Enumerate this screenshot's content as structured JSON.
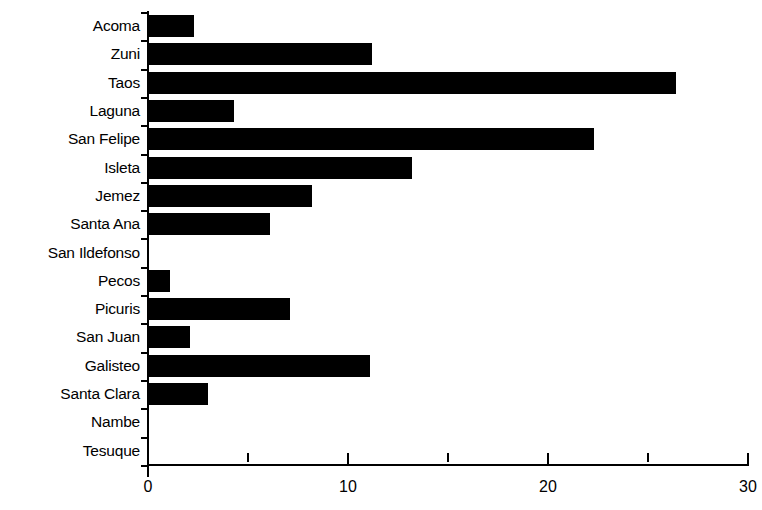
{
  "chart_data": {
    "type": "bar",
    "orientation": "horizontal",
    "title": "",
    "subtitle": "",
    "xlabel": "",
    "ylabel": "",
    "xlim": [
      0,
      30
    ],
    "ylim": null,
    "grid": false,
    "legend": null,
    "bar_color": "#000000",
    "background_color": "#ffffff",
    "axis_color": "#000000",
    "x_ticks_major": [
      "0",
      "10",
      "20",
      "30"
    ],
    "x_ticks_major_values": [
      0,
      10,
      20,
      30
    ],
    "x_ticks_minor_values": [
      5,
      15,
      25
    ],
    "categories": [
      "Acoma",
      "Zuni",
      "Taos",
      "Laguna",
      "San Felipe",
      "Isleta",
      "Jemez",
      "Santa Ana",
      "San Ildefonso",
      "Pecos",
      "Picuris",
      "San Juan",
      "Galisteo",
      "Santa Clara",
      "Nambe",
      "Tesuque"
    ],
    "values": [
      2.3,
      11.2,
      26.4,
      4.3,
      22.3,
      13.2,
      8.2,
      6.1,
      0,
      1.1,
      7.1,
      2.1,
      11.1,
      3.0,
      0,
      0
    ]
  }
}
